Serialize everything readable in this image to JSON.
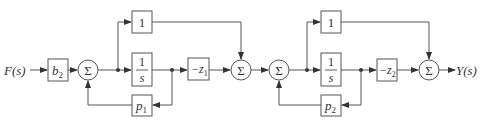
{
  "diagram": {
    "type": "block-diagram",
    "input": {
      "label": "F(s)"
    },
    "output": {
      "label": "Y(s)"
    },
    "blocks": [
      {
        "id": "b2",
        "label": "b",
        "sub": "2"
      },
      {
        "id": "sum1",
        "label": "Σ"
      },
      {
        "id": "one1",
        "label": "1"
      },
      {
        "id": "int1",
        "num": "1",
        "den": "s"
      },
      {
        "id": "p1",
        "label": "p",
        "sub": "1"
      },
      {
        "id": "negz1",
        "label": "−z",
        "sub": "1"
      },
      {
        "id": "sum2",
        "label": "Σ"
      },
      {
        "id": "sum3",
        "label": "Σ"
      },
      {
        "id": "one2",
        "label": "1"
      },
      {
        "id": "int2",
        "num": "1",
        "den": "s"
      },
      {
        "id": "p2",
        "label": "p",
        "sub": "2"
      },
      {
        "id": "negz2",
        "label": "−z",
        "sub": "2"
      },
      {
        "id": "sum4",
        "label": "Σ"
      }
    ],
    "connections": [
      [
        "F(s)",
        "b2"
      ],
      [
        "b2",
        "sum1"
      ],
      [
        "sum1",
        "one1"
      ],
      [
        "sum1",
        "int1"
      ],
      [
        "int1",
        "negz1"
      ],
      [
        "int1",
        "p1"
      ],
      [
        "p1",
        "sum1"
      ],
      [
        "one1",
        "sum2"
      ],
      [
        "negz1",
        "sum2"
      ],
      [
        "sum2",
        "sum3"
      ],
      [
        "sum3",
        "one2"
      ],
      [
        "sum3",
        "int2"
      ],
      [
        "int2",
        "negz2"
      ],
      [
        "int2",
        "p2"
      ],
      [
        "p2",
        "sum3"
      ],
      [
        "one2",
        "sum4"
      ],
      [
        "negz2",
        "sum4"
      ],
      [
        "sum4",
        "Y(s)"
      ]
    ]
  }
}
